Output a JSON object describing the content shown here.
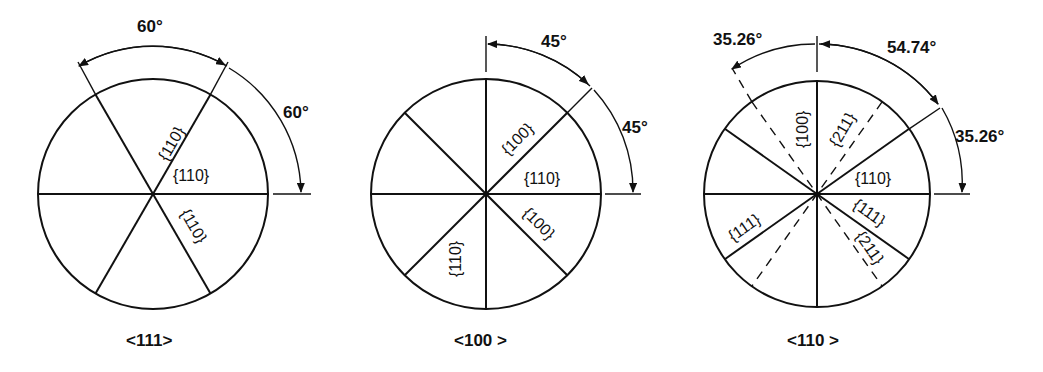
{
  "panels": [
    {
      "orientation": "<111>",
      "angles": [
        "60°",
        "60°"
      ],
      "plane_labels": [
        "{110}",
        "{110}",
        "{110}"
      ]
    },
    {
      "orientation": "<100 >",
      "angles": [
        "45°",
        "45°"
      ],
      "plane_labels": [
        "{100}",
        "{110}",
        "{100}",
        "{110}"
      ]
    },
    {
      "orientation": "<110 >",
      "angles": [
        "35.26°",
        "54.74°",
        "35.26°"
      ],
      "plane_labels": [
        "{100}",
        "{211}",
        "{110}",
        "{111}",
        "{111}",
        "{211}"
      ]
    }
  ],
  "colors": {
    "line": "#111111",
    "background": "#ffffff"
  }
}
